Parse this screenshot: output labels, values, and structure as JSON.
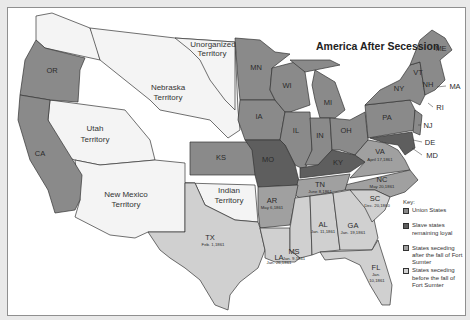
{
  "title": "America After Secession",
  "colors": {
    "union": "#8a8a8a",
    "slave_loyal": "#5e5e5e",
    "seceding_after": "#a0a0a0",
    "seceding_before": "#d0d0d0",
    "territory": "#f4f4f4"
  },
  "territories": [
    {
      "name": "Unorganized",
      "sub": "Territory"
    },
    {
      "name": "Nebraska",
      "sub": "Territory"
    },
    {
      "name": "Utah",
      "sub": "Territory"
    },
    {
      "name": "New Mexico",
      "sub": "Territory"
    },
    {
      "name": "Indian",
      "sub": "Territory"
    }
  ],
  "states": {
    "union": [
      "OR",
      "CA",
      "MN",
      "WI",
      "MI",
      "IA",
      "KS",
      "IL",
      "IN",
      "OH",
      "PA",
      "NY",
      "VT",
      "NH",
      "ME",
      "MA",
      "RI",
      "CT",
      "NJ"
    ],
    "slave_loyal": [
      "MO",
      "KY",
      "MD",
      "DE"
    ],
    "seceding_after": [
      {
        "abbr": "VA",
        "date": "April 17,1861"
      },
      {
        "abbr": "NC",
        "date": "May 20,1861"
      },
      {
        "abbr": "TN",
        "date": "June 8,1861"
      },
      {
        "abbr": "AR",
        "date": "May 6,1861"
      }
    ],
    "seceding_before": [
      {
        "abbr": "SC",
        "date": "Dec. 20,1860"
      },
      {
        "abbr": "MS",
        "date": "Jan. 9,1861"
      },
      {
        "abbr": "FL",
        "date": "Jan. 10,1861"
      },
      {
        "abbr": "AL",
        "date": "Jan. 11,1861"
      },
      {
        "abbr": "GA",
        "date": "Jan. 19,1861"
      },
      {
        "abbr": "LA",
        "date": "Jan. 26,1861"
      },
      {
        "abbr": "TX",
        "date": "Feb. 1,1861"
      }
    ]
  },
  "callouts": [
    "MA",
    "RI",
    "NJ",
    "DE",
    "MD"
  ],
  "key": {
    "title": "Key:",
    "items": [
      {
        "label": "Union States"
      },
      {
        "label": "Slave states remaining loyal"
      },
      {
        "label": "States seceding after the fall of Fort Sumter"
      },
      {
        "label": "States seceding before the fall of Fort Sumter"
      }
    ]
  }
}
